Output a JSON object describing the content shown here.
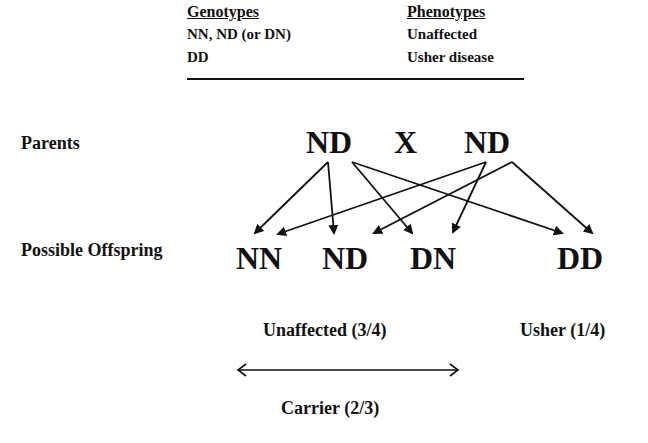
{
  "legend": {
    "headers": {
      "genotypes": "Genotypes",
      "phenotypes": "Phenotypes"
    },
    "rows": [
      {
        "genotype": "NN,  ND (or DN)",
        "phenotype": "Unaffected"
      },
      {
        "genotype": "DD",
        "phenotype": "Usher disease"
      }
    ]
  },
  "parents": {
    "label": "Parents",
    "left": "ND",
    "cross": "X",
    "right": "ND"
  },
  "offspring": {
    "label": "Possible Offspring",
    "items": [
      "NN",
      "ND",
      "DN",
      "DD"
    ]
  },
  "summary": {
    "unaffected": "Unaffected (3/4)",
    "usher": "Usher (1/4)",
    "carrier": "Carrier (2/3)"
  }
}
